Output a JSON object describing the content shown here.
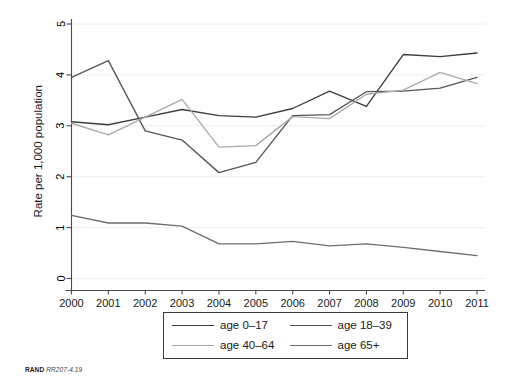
{
  "figure": {
    "background_color": "#ffffff",
    "footer": {
      "organization": "RAND",
      "report_id": "RR207-4.19"
    }
  },
  "legend": {
    "position": "below-plot",
    "border_color": "#3a3a3a",
    "entries": [
      {
        "label": "age 0–17",
        "color": "#3d3d3d",
        "series_key": "age_0_17"
      },
      {
        "label": "age 18–39",
        "color": "#555555",
        "series_key": "age_18_39"
      },
      {
        "label": "age 40–64",
        "color": "#aaaaaa",
        "series_key": "age_40_64"
      },
      {
        "label": "age 65+",
        "color": "#6e6e6e",
        "series_key": "age_65_plus"
      }
    ]
  },
  "chart_data": {
    "type": "line",
    "title": "",
    "subtitle": "",
    "xlabel": "",
    "ylabel": "Rate per 1,000 population",
    "x": [
      2000,
      2001,
      2002,
      2003,
      2004,
      2005,
      2006,
      2007,
      2008,
      2009,
      2010,
      2011
    ],
    "categories": [
      "2000",
      "2001",
      "2002",
      "2003",
      "2004",
      "2005",
      "2006",
      "2007",
      "2008",
      "2009",
      "2010",
      "2011"
    ],
    "xlim": [
      2000,
      2011
    ],
    "ylim": [
      0,
      5
    ],
    "y_ticks": [
      0,
      1,
      2,
      3,
      4,
      5
    ],
    "y_tick_labels": [
      "0",
      "1",
      "2",
      "3",
      "4",
      "5"
    ],
    "grid": "horizontal-light",
    "legend_position": "bottom",
    "series": [
      {
        "name": "age 0–17",
        "color": "#3d3d3d",
        "values": [
          3.08,
          3.02,
          3.17,
          3.32,
          3.2,
          3.17,
          3.34,
          3.68,
          3.38,
          4.4,
          4.36,
          4.43
        ]
      },
      {
        "name": "age 18–39",
        "color": "#555555",
        "values": [
          3.95,
          4.28,
          2.9,
          2.72,
          2.08,
          2.28,
          3.2,
          3.22,
          3.67,
          3.68,
          3.74,
          3.95
        ]
      },
      {
        "name": "age 40–64",
        "color": "#aaaaaa",
        "values": [
          3.05,
          2.82,
          3.17,
          3.52,
          2.58,
          2.61,
          3.18,
          3.14,
          3.62,
          3.7,
          4.05,
          3.83
        ]
      },
      {
        "name": "age 65+",
        "color": "#6e6e6e",
        "values": [
          1.24,
          1.09,
          1.09,
          1.03,
          0.68,
          0.68,
          0.73,
          0.64,
          0.68,
          0.61,
          0.53,
          0.45
        ]
      }
    ]
  }
}
